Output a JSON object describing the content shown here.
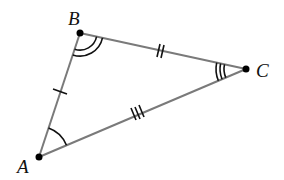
{
  "diagram": {
    "type": "triangle",
    "vertices": {
      "A": {
        "label": "A",
        "x": 39,
        "y": 157
      },
      "B": {
        "label": "B",
        "x": 80,
        "y": 33
      },
      "C": {
        "label": "C",
        "x": 246,
        "y": 69
      }
    },
    "sides": [
      {
        "name": "AB",
        "tick_marks": 1
      },
      {
        "name": "BC",
        "tick_marks": 2
      },
      {
        "name": "AC",
        "tick_marks": 3
      }
    ],
    "angles": [
      {
        "vertex": "A",
        "arc_marks": 1
      },
      {
        "vertex": "B",
        "arc_marks": 2
      },
      {
        "vertex": "C",
        "arc_marks": 3
      }
    ],
    "colors": {
      "side": "#7a7a7a",
      "mark": "#111111",
      "vertex": "#000000",
      "background": "#ffffff"
    }
  }
}
